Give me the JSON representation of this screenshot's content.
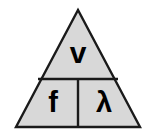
{
  "figure": {
    "name": "wave-speed-formula-triangle",
    "shape": "triangle",
    "background_color": "#ffffff",
    "fill_color": "#d8d8d8",
    "stroke_color": "#1a1a1a",
    "stroke_width": 2,
    "geometry": {
      "apex_x": 78,
      "apex_y": 10,
      "base_left_x": 16,
      "base_right_x": 140,
      "base_y": 127,
      "horizontal_divider_y": 79,
      "horizontal_divider_left_x": 38,
      "horizontal_divider_right_x": 118,
      "vertical_divider_x": 78
    },
    "cells": {
      "top": {
        "symbol": "v",
        "meaning": "wave speed"
      },
      "bottom_left": {
        "symbol": "f",
        "meaning": "frequency"
      },
      "bottom_right": {
        "symbol": "λ",
        "meaning": "wavelength"
      }
    }
  }
}
